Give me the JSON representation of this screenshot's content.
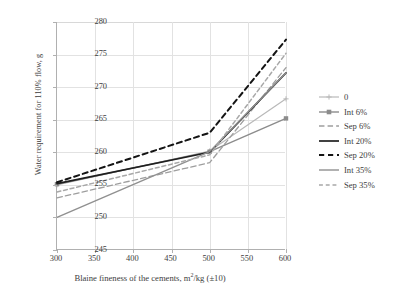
{
  "chart_data": {
    "type": "line",
    "title": "",
    "xlabel": "Blaine fineness of the cements, m2/kg (±10)",
    "xlabel_main": "Blaine fineness of the cements, m",
    "xlabel_sup": "2",
    "xlabel_tail": "/kg (±10)",
    "ylabel": "Water requirement for 110% flow, g",
    "x": [
      300,
      500,
      600
    ],
    "xlim": [
      300,
      600
    ],
    "ylim": [
      245,
      280
    ],
    "xticks": [
      300,
      350,
      400,
      450,
      500,
      550,
      600
    ],
    "yticks": [
      245,
      250,
      255,
      260,
      265,
      270,
      275,
      280
    ],
    "grid": true,
    "legend_position": "right",
    "series": [
      {
        "name": "0",
        "values": [
          255.0,
          260.2,
          268.2
        ],
        "color": "#b9b9b9",
        "dash": "none",
        "width": 1.2,
        "marker": "cross"
      },
      {
        "name": "Int 6%",
        "values": [
          255.1,
          260.1,
          265.2
        ],
        "color": "#8c8c8c",
        "dash": "none",
        "width": 1.4,
        "marker": "square"
      },
      {
        "name": "Sep 6%",
        "values": [
          253.0,
          258.4,
          273.0
        ],
        "color": "#9e9e9e",
        "dash": "long",
        "width": 1.3,
        "marker": "none"
      },
      {
        "name": "Int 20%",
        "values": [
          255.2,
          260.0,
          272.2
        ],
        "color": "#1f1f1f",
        "dash": "none",
        "width": 1.7,
        "marker": "none"
      },
      {
        "name": "Sep 20%",
        "values": [
          255.4,
          263.0,
          277.3
        ],
        "color": "#141414",
        "dash": "dash",
        "width": 2.0,
        "marker": "none"
      },
      {
        "name": "Int 35%",
        "values": [
          250.0,
          260.1,
          272.2
        ],
        "color": "#909090",
        "dash": "none",
        "width": 1.4,
        "marker": "none"
      },
      {
        "name": "Sep 35%",
        "values": [
          253.9,
          259.6,
          275.2
        ],
        "color": "#a8a8a8",
        "dash": "dash",
        "width": 1.5,
        "marker": "none"
      }
    ]
  },
  "legend": {
    "items": [
      {
        "label": "0"
      },
      {
        "label": "Int 6%"
      },
      {
        "label": "Sep 6%"
      },
      {
        "label": "Int 20%"
      },
      {
        "label": "Sep 20%"
      },
      {
        "label": "Int 35%"
      },
      {
        "label": "Sep 35%"
      }
    ]
  }
}
